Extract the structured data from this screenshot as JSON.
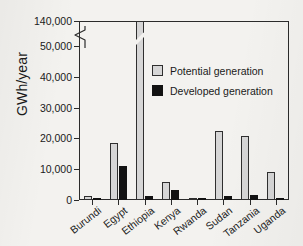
{
  "chart_data": {
    "type": "bar",
    "title": "",
    "xlabel": "",
    "ylabel": "GWh/year",
    "categories": [
      "Burundi",
      "Egypt",
      "Ethiopia",
      "Kenya",
      "Rwanda",
      "Sudan",
      "Tanzania",
      "Uganda"
    ],
    "series": [
      {
        "name": "Potential generation",
        "color": "#d6d6d6",
        "values": [
          1300,
          18400,
          140000,
          6000,
          500,
          22300,
          20700,
          9000
        ]
      },
      {
        "name": "Developed generation",
        "color": "#121212",
        "values": [
          400,
          11200,
          1200,
          3400,
          150,
          1200,
          1700,
          800
        ]
      }
    ],
    "ylim": [
      0,
      140000
    ],
    "yticks": [
      0,
      10000,
      20000,
      30000,
      40000,
      50000,
      140000
    ],
    "ytick_labels": [
      "0",
      "10,000",
      "20,000",
      "30,000",
      "40,000",
      "50,000",
      "140,000"
    ],
    "axis_break": {
      "present": true,
      "between": [
        50000,
        140000
      ],
      "note": "zigzag break on y-axis and through Ethiopia potential bar"
    },
    "grid": false,
    "legend_position": "inside-upper-center"
  },
  "axis": {
    "y_title": "GWh/year"
  },
  "legend": {
    "items": [
      {
        "label": "Potential generation"
      },
      {
        "label": "Developed generation"
      }
    ]
  }
}
